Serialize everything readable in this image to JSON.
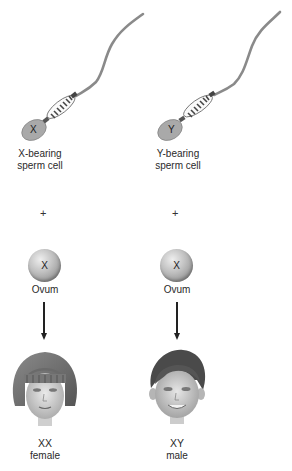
{
  "left_column": {
    "sperm_chromosome": "X",
    "sperm_label_line1": "X-bearing",
    "sperm_label_line2": "sperm cell",
    "plus": "+",
    "ovum_chromosome": "X",
    "ovum_label": "Ovum",
    "genotype": "XX",
    "sex": "female"
  },
  "right_column": {
    "sperm_chromosome": "Y",
    "sperm_label_line1": "Y-bearing",
    "sperm_label_line2": "sperm cell",
    "plus": "+",
    "ovum_chromosome": "X",
    "ovum_label": "Ovum",
    "genotype": "XY",
    "sex": "male"
  }
}
